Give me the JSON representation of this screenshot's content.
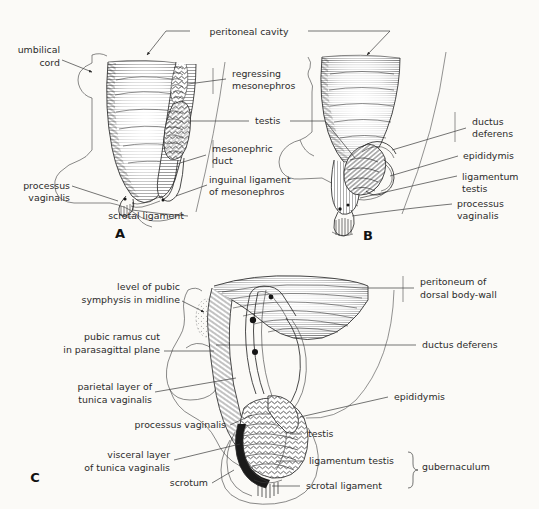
{
  "figure": {
    "background_color": "#fbfaf7",
    "ink_color": "#1a1a1a",
    "panel_count": 3
  },
  "panels": [
    {
      "id": "A",
      "letter": "A",
      "caption": "A",
      "stage": "testis intra-abdominal, mesonephros regressing"
    },
    {
      "id": "B",
      "letter": "B",
      "caption": "B",
      "stage": "testis at deep inguinal ring, gubernaculum shortening"
    },
    {
      "id": "C",
      "letter": "C",
      "caption": "C",
      "stage": "testis descended into scrotum, parasagittal section"
    }
  ],
  "labels": {
    "shared": {
      "peritoneal_cavity": "peritoneal cavity"
    },
    "panelA": {
      "umbilical_cord": "umbilical cord",
      "umbilical_cord_line1": "umbilical",
      "umbilical_cord_line2": "cord",
      "regressing_mesonephros_line1": "regressing",
      "regressing_mesonephros_line2": "mesonephros",
      "testis": "testis",
      "mesonephric_duct_line1": "mesonephric",
      "mesonephric_duct_line2": "duct",
      "inguinal_ligament_line1": "inguinal ligament",
      "inguinal_ligament_line2": "of mesonephros",
      "processus_vaginalis_line1": "processus",
      "processus_vaginalis_line2": "vaginalis",
      "scrotal_ligament": "scrotal ligament"
    },
    "panelB": {
      "ductus_deferens_line1": "ductus",
      "ductus_deferens_line2": "deferens",
      "epididymis": "epididymis",
      "ligamentum_testis_line1": "ligamentum",
      "ligamentum_testis_line2": "testis",
      "processus_vaginalis_line1": "processus",
      "processus_vaginalis_line2": "vaginalis"
    },
    "panelC": {
      "level_pubic_symphysis_line1": "level of pubic",
      "level_pubic_symphysis_line2": "symphysis in midline",
      "pubic_ramus_line1": "pubic ramus cut",
      "pubic_ramus_line2": "in parasagittal plane",
      "parietal_layer_line1": "parietal layer of",
      "parietal_layer_line2": "tunica vaginalis",
      "processus_vaginalis": "processus vaginalis",
      "visceral_layer_line1": "visceral layer",
      "visceral_layer_line2": "of tunica vaginalis",
      "scrotum": "scrotum",
      "peritoneum_dorsal_line1": "peritoneum of",
      "peritoneum_dorsal_line2": "dorsal body-wall",
      "ductus_deferens": "ductus deferens",
      "epididymis": "epididymis",
      "testis": "testis",
      "ligamentum_testis": "ligamentum testis",
      "scrotal_ligament": "scrotal ligament",
      "gubernaculum": "gubernaculum"
    }
  }
}
